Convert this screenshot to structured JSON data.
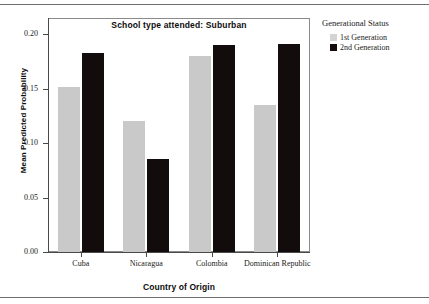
{
  "figure": {
    "plot_title": "School type attended: Suburban",
    "legend": {
      "title": "Generational Status",
      "entries": [
        {
          "label": "1st Generation",
          "color": "#d4d4d4",
          "swatch": "legend-swatch-1st-generation"
        },
        {
          "label": "2nd Generation",
          "color": "#120c0c",
          "swatch": "legend-swatch-2nd-generation"
        }
      ]
    }
  },
  "chart_data": {
    "type": "bar",
    "title": "School type attended: Suburban",
    "xlabel": "Country of Origin",
    "ylabel": "Mean Predicted Probability",
    "categories": [
      "Cuba",
      "Nicaragua",
      "Colombia",
      "Dominican Republic"
    ],
    "series": [
      {
        "name": "1st Generation",
        "color": "#c9c9c9",
        "values": [
          0.151,
          0.12,
          0.18,
          0.135
        ]
      },
      {
        "name": "2nd Generation",
        "color": "#120c0c",
        "values": [
          0.183,
          0.085,
          0.19,
          0.191
        ]
      }
    ],
    "ylim": [
      0.0,
      0.2
    ],
    "yticks": [
      0.0,
      0.05,
      0.1,
      0.15,
      0.2
    ],
    "ytick_labels": [
      "0.00",
      "0.05",
      "0.10",
      "0.15",
      "0.20"
    ],
    "grid": false,
    "legend_position": "right-outside"
  }
}
